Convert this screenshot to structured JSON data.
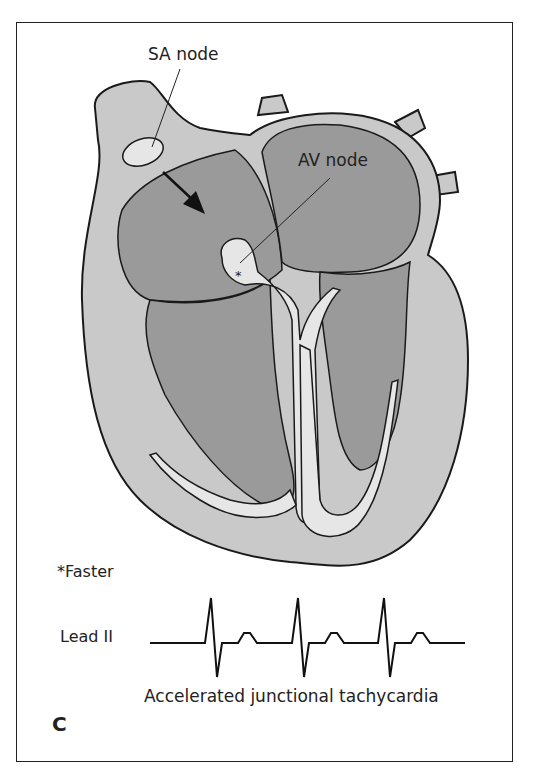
{
  "figure": {
    "panel_letter": "C",
    "labels": {
      "sa_node": "SA node",
      "av_node": "AV node",
      "av_marker": "*",
      "footnote": "*Faster"
    },
    "ecg": {
      "lead": "Lead II",
      "caption": "Accelerated junctional tachycardia",
      "beats": 3
    },
    "colors": {
      "wall": "#c9c9c9",
      "chamber": "#9a9a9a",
      "conduction": "#e6e6e6",
      "stroke": "#1a1a1a"
    }
  }
}
